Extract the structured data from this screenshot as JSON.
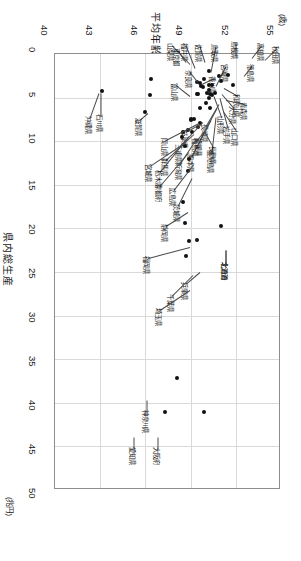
{
  "chart_data": {
    "type": "scatter",
    "title": "平均年齢",
    "xlabel": "平均年齢",
    "ylabel": "県内総生産",
    "x_unit": "(歳)",
    "y_unit": "(兆円)",
    "xlim": [
      40,
      55
    ],
    "ylim": [
      0,
      50
    ],
    "x_ticks": [
      "40",
      "43",
      "46",
      "49",
      "52",
      "55"
    ],
    "y_ticks": [
      "0",
      "5",
      "10",
      "15",
      "20",
      "25",
      "30",
      "35",
      "40",
      "45",
      "50"
    ],
    "grid": true,
    "legend": "none",
    "y_axis_inverted": true,
    "note": "横軸=平均年齢(歳)は上端、縦軸=県内総生産(兆円)は左端で下向きに増加",
    "points": [
      {
        "label": "沖縄県",
        "x": 43.1,
        "y": 4.3
      },
      {
        "label": "石川県",
        "x": 46.3,
        "y": 4.7
      },
      {
        "label": "滋賀県",
        "x": 46.0,
        "y": 6.6
      },
      {
        "label": "東京都",
        "x": 46.4,
        "y": 2.9
      },
      {
        "label": "愛知県",
        "x": 47.3,
        "y": 41.1
      },
      {
        "label": "大阪府",
        "x": 49.9,
        "y": 41.1
      },
      {
        "label": "神奈川県",
        "x": 48.1,
        "y": 37.1
      },
      {
        "label": "埼玉県",
        "x": 48.7,
        "y": 23.2
      },
      {
        "label": "千葉県",
        "x": 48.9,
        "y": 21.5
      },
      {
        "label": "兵庫県",
        "x": 49.4,
        "y": 21.3
      },
      {
        "label": "北海道",
        "x": 51.0,
        "y": 19.7
      },
      {
        "label": "福岡県",
        "x": 48.6,
        "y": 19.4
      },
      {
        "label": "静岡県",
        "x": 48.5,
        "y": 17.0
      },
      {
        "label": "茨城県",
        "x": 48.8,
        "y": 13.4
      },
      {
        "label": "広島県",
        "x": 48.9,
        "y": 12.0
      },
      {
        "label": "京都府",
        "x": 48.6,
        "y": 10.6
      },
      {
        "label": "宮城県",
        "x": 48.4,
        "y": 9.5
      },
      {
        "label": "新潟県",
        "x": 49.1,
        "y": 9.0
      },
      {
        "label": "長野県",
        "x": 49.5,
        "y": 8.4
      },
      {
        "label": "栃木県",
        "x": 48.5,
        "y": 8.9
      },
      {
        "label": "群馬県",
        "x": 48.8,
        "y": 8.7
      },
      {
        "label": "福島県",
        "x": 49.6,
        "y": 7.9
      },
      {
        "label": "岐阜県",
        "x": 49.0,
        "y": 7.6
      },
      {
        "label": "岡山県",
        "x": 49.0,
        "y": 7.5
      },
      {
        "label": "三重県",
        "x": 49.2,
        "y": 7.4
      },
      {
        "label": "熊本県",
        "x": 49.6,
        "y": 6.2
      },
      {
        "label": "鹿児島県",
        "x": 50.0,
        "y": 5.6
      },
      {
        "label": "山口県",
        "x": 50.3,
        "y": 6.2
      },
      {
        "label": "愛媛県",
        "x": 50.2,
        "y": 5.1
      },
      {
        "label": "長崎県",
        "x": 50.3,
        "y": 4.6
      },
      {
        "label": "青森県",
        "x": 50.6,
        "y": 4.5
      },
      {
        "label": "岩手県",
        "x": 50.4,
        "y": 4.7
      },
      {
        "label": "山形県",
        "x": 50.2,
        "y": 4.1
      },
      {
        "label": "大分県",
        "x": 50.1,
        "y": 4.5
      },
      {
        "label": "石川県2",
        "x": 49.4,
        "y": 4.6
      },
      {
        "label": "富山県",
        "x": 49.5,
        "y": 4.6
      },
      {
        "label": "奈良県",
        "x": 49.7,
        "y": 3.7
      },
      {
        "label": "香川県",
        "x": 49.8,
        "y": 3.8
      },
      {
        "label": "和歌山県",
        "x": 50.4,
        "y": 3.6
      },
      {
        "label": "宮崎県",
        "x": 50.2,
        "y": 3.6
      },
      {
        "label": "秋田県",
        "x": 51.8,
        "y": 3.5
      },
      {
        "label": "高知県",
        "x": 51.5,
        "y": 2.4
      },
      {
        "label": "徳島県",
        "x": 51.0,
        "y": 3.1
      },
      {
        "label": "島根県",
        "x": 50.9,
        "y": 2.5
      },
      {
        "label": "鳥取県",
        "x": 50.2,
        "y": 1.9
      },
      {
        "label": "佐賀県",
        "x": 49.9,
        "y": 2.9
      },
      {
        "label": "福井県",
        "x": 49.6,
        "y": 3.3
      },
      {
        "label": "山梨県",
        "x": 49.4,
        "y": 3.2
      }
    ],
    "callouts": [
      {
        "label": "秋田県",
        "px": 265,
        "py": 60,
        "lx": 277,
        "ly": 48
      },
      {
        "label": "高知県",
        "px": 252,
        "py": 58,
        "lx": 262,
        "ly": 45
      },
      {
        "label": "島根県",
        "px": 236,
        "py": 56,
        "lx": 236,
        "ly": 43
      },
      {
        "label": "徳島県",
        "px": 244,
        "py": 76,
        "lx": 252,
        "ly": 66
      },
      {
        "label": "鳥取県",
        "px": 211,
        "py": 72,
        "lx": 216,
        "ly": 46
      },
      {
        "label": "佐賀県",
        "px": 205,
        "py": 62,
        "lx": 200,
        "ly": 46
      },
      {
        "label": "福井県",
        "px": 195,
        "py": 68,
        "lx": 186,
        "ly": 45
      },
      {
        "label": "山梨県",
        "px": 190,
        "py": 64,
        "lx": 172,
        "ly": 45
      },
      {
        "label": "宮崎県",
        "px": 216,
        "py": 86,
        "lx": 226,
        "ly": 66
      },
      {
        "label": "和歌山県",
        "px": 224,
        "py": 88,
        "lx": 238,
        "ly": 96
      },
      {
        "label": "香川県",
        "px": 202,
        "py": 84,
        "lx": 214,
        "ly": 78
      },
      {
        "label": "奈良県",
        "px": 198,
        "py": 82,
        "lx": 190,
        "ly": 72
      },
      {
        "label": "大分県",
        "px": 222,
        "py": 94,
        "lx": 234,
        "ly": 108
      },
      {
        "label": "山形県",
        "px": 214,
        "py": 96,
        "lx": 222,
        "ly": 118
      },
      {
        "label": "岩手県",
        "px": 220,
        "py": 98,
        "lx": 228,
        "ly": 128
      },
      {
        "label": "青森県",
        "px": 226,
        "py": 100,
        "lx": 245,
        "ly": 104
      },
      {
        "label": "長崎県",
        "px": 219,
        "py": 104,
        "lx": 206,
        "ly": 126
      },
      {
        "label": "愛媛県",
        "px": 217,
        "py": 108,
        "lx": 200,
        "ly": 140
      },
      {
        "label": "山口県",
        "px": 224,
        "py": 112,
        "lx": 236,
        "ly": 130
      },
      {
        "label": "鹿児島県",
        "px": 216,
        "py": 117,
        "lx": 212,
        "ly": 152
      },
      {
        "label": "熊本県",
        "px": 211,
        "py": 120,
        "lx": 192,
        "ly": 156
      },
      {
        "label": "富山県",
        "px": 190,
        "py": 96,
        "lx": 176,
        "ly": 85
      },
      {
        "label": "石川県",
        "px": 101,
        "py": 93,
        "lx": 101,
        "ly": 116
      },
      {
        "label": "沖縄県",
        "px": 99,
        "py": 93,
        "lx": 90,
        "ly": 118
      },
      {
        "label": "滋賀県",
        "px": 148,
        "py": 113,
        "lx": 140,
        "ly": 120
      },
      {
        "label": "東京都",
        "px": 186,
        "py": 62,
        "lx": 178,
        "ly": 50
      },
      {
        "label": "福島県",
        "px": 208,
        "py": 127,
        "lx": 197,
        "ly": 140
      },
      {
        "label": "岐阜県",
        "px": 200,
        "py": 124,
        "lx": 186,
        "ly": 132
      },
      {
        "label": "三重県",
        "px": 203,
        "py": 122,
        "lx": 180,
        "ly": 146
      },
      {
        "label": "岡山県",
        "px": 199,
        "py": 123,
        "lx": 166,
        "ly": 140
      },
      {
        "label": "長野県",
        "px": 205,
        "py": 132,
        "lx": 214,
        "ly": 148
      },
      {
        "label": "群馬県",
        "path": "leader",
        "px": 194,
        "py": 134,
        "lx": 166,
        "ly": 160
      },
      {
        "label": "栃木県",
        "px": 189,
        "py": 136,
        "lx": 160,
        "ly": 172
      },
      {
        "label": "新潟県",
        "px": 197,
        "py": 138,
        "lx": 180,
        "ly": 164
      },
      {
        "label": "宮城県",
        "px": 186,
        "py": 142,
        "lx": 150,
        "ly": 166
      },
      {
        "label": "京都府",
        "px": 189,
        "py": 152,
        "lx": 160,
        "ly": 186
      },
      {
        "label": "広島県",
        "px": 194,
        "py": 164,
        "lx": 174,
        "ly": 190
      },
      {
        "label": "茨城県",
        "px": 192,
        "py": 178,
        "lx": 178,
        "ly": 206
      },
      {
        "label": "静岡県",
        "px": 188,
        "py": 212,
        "lx": 166,
        "ly": 226
      },
      {
        "label": "福岡県",
        "px": 190,
        "py": 247,
        "lx": 148,
        "ly": 258
      },
      {
        "label": "北道海",
        "px": 226,
        "py": 250,
        "lx": 226,
        "ly": 264
      },
      {
        "label": "北海道",
        "px": 226,
        "py": 250,
        "lx": 226,
        "ly": 264
      },
      {
        "label": "兵庫県",
        "px": 200,
        "py": 272,
        "lx": 186,
        "ly": 284
      },
      {
        "label": "千葉県",
        "px": 193,
        "py": 275,
        "lx": 172,
        "ly": 296
      },
      {
        "label": "埼玉県",
        "px": 190,
        "py": 290,
        "lx": 160,
        "ly": 310
      },
      {
        "label": "神奈川県",
        "px": 147,
        "py": 400,
        "lx": 147,
        "ly": 412
      },
      {
        "label": "愛知県",
        "px": 134,
        "py": 437,
        "lx": 134,
        "ly": 449
      },
      {
        "label": "大阪府",
        "px": 158,
        "py": 437,
        "lx": 158,
        "ly": 449
      }
    ]
  },
  "axes": {
    "x_title": "平均年齢",
    "x_unit": "(歳)",
    "y_title": "県内総生産",
    "y_unit": "(兆円)",
    "x_ticks": [
      "40",
      "43",
      "46",
      "49",
      "52",
      "55"
    ],
    "y_ticks": [
      "0",
      "5",
      "10",
      "15",
      "20",
      "25",
      "30",
      "35",
      "40",
      "45",
      "50"
    ]
  }
}
